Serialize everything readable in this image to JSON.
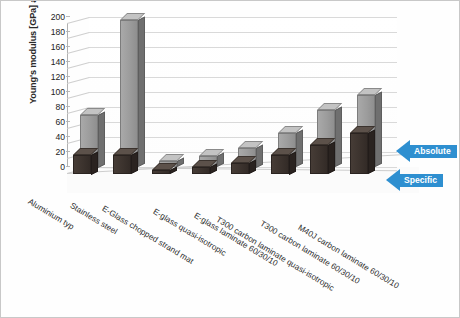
{
  "chart_data": {
    "type": "bar",
    "title": "",
    "xlabel": "",
    "ylabel": "Young's modulus [GPa] and [GPa/(t/m^3)]",
    "ylim": [
      0,
      200
    ],
    "yticks": [
      200,
      180,
      160,
      140,
      120,
      100,
      80,
      60,
      40,
      20,
      0
    ],
    "grid": true,
    "threeD": true,
    "legend_position": "right-callouts",
    "categories": [
      "Aluminium typ",
      "Stainless steel",
      "E-Glass chopped strand mat",
      "E-glass quasi-isotropic",
      "E-glass laminate 60/30/10",
      "T300 carbon laminate quasi-isotropic",
      "T300 carbon laminate 60/30/10",
      "M40J carbon laminate 60/30/10"
    ],
    "series": [
      {
        "name": "Absolute",
        "unit": "GPa",
        "color": "#9c9c9c",
        "values": [
          70,
          196,
          8,
          15,
          26,
          45,
          76,
          96
        ]
      },
      {
        "name": "Specific",
        "unit": "GPa/(t/m^3)",
        "color": "#3c332e",
        "values": [
          26,
          25,
          5,
          9,
          15,
          26,
          39,
          55
        ]
      }
    ],
    "annotations": [
      {
        "text": "Absolute",
        "points_to": "light-grey-series",
        "color": "#2e8fd0"
      },
      {
        "text": "Specific",
        "points_to": "dark-series",
        "color": "#2e8fd0"
      }
    ]
  },
  "callouts": {
    "absolute": "Absolute",
    "specific": "Specific"
  }
}
